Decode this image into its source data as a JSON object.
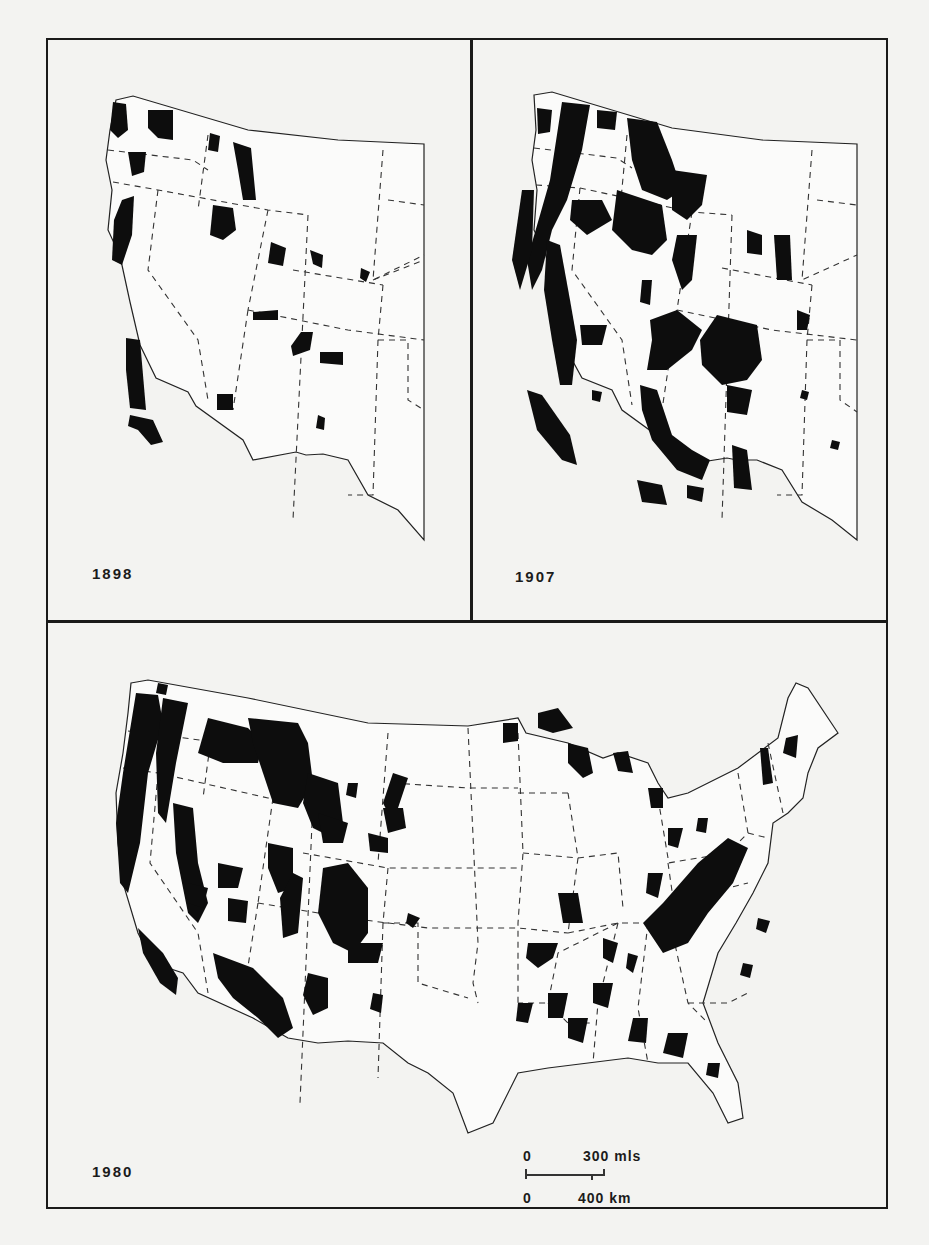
{
  "figure": {
    "panels": [
      {
        "id": "1898",
        "label": "1898",
        "region": "Western United States"
      },
      {
        "id": "1907",
        "label": "1907",
        "region": "Western United States"
      },
      {
        "id": "1980",
        "label": "1980",
        "region": "Conterminous United States"
      }
    ],
    "scale_bar": {
      "top_zero": "0",
      "top_value": "300 mls",
      "bottom_zero": "0",
      "bottom_value": "400 km"
    },
    "legend": {
      "forest_fill": "#0d0d0d",
      "state_boundaries": "dashed",
      "national_boundary": "solid"
    }
  },
  "colors": {
    "page_background": "#f3f3f1",
    "ink": "#1a1a1a"
  }
}
